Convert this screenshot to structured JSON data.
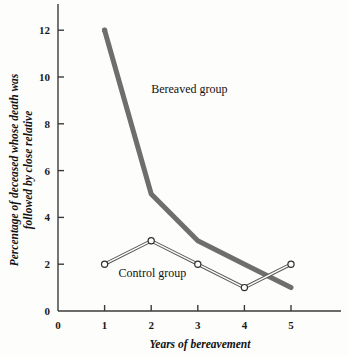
{
  "chart_data": {
    "type": "line",
    "title": "",
    "xlabel": "Years of bereavement",
    "ylabel": "Percentage of deceased whose death was followed by close relative",
    "ylabel_line1": "Percentage of deceased whose death was",
    "ylabel_line2": "followed by close relative",
    "x": [
      1,
      2,
      3,
      4,
      5
    ],
    "xlim": [
      0,
      5.9
    ],
    "ylim": [
      0,
      12.9
    ],
    "xticks": [
      0,
      1,
      2,
      3,
      4,
      5
    ],
    "yticks": [
      0,
      2,
      4,
      6,
      8,
      10,
      12
    ],
    "xtick_labels": [
      "0",
      "1",
      "2",
      "3",
      "4",
      "5"
    ],
    "ytick_labels": [
      "0",
      "2",
      "4",
      "6",
      "8",
      "10",
      "12"
    ],
    "grid": false,
    "legend_position": "inline-annotation",
    "series": [
      {
        "name": "Bereaved group",
        "values": [
          12,
          5,
          3,
          2,
          1
        ],
        "color": "#6e6e6e",
        "line_width": 5,
        "marker": "none",
        "label_x": 2.0,
        "label_y": 9.3
      },
      {
        "name": "Control group",
        "values": [
          2,
          3,
          2,
          1,
          2
        ],
        "color": "#555555",
        "line_width": 1.1,
        "marker": "open-circle",
        "label_x": 1.3,
        "label_y": 1.45
      }
    ],
    "annotations": [
      {
        "text": "Bereaved group",
        "x": 2.0,
        "y": 9.3
      },
      {
        "text": "Control group",
        "x": 1.3,
        "y": 1.45
      }
    ]
  }
}
